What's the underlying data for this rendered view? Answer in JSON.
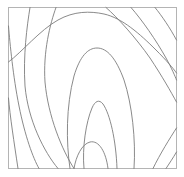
{
  "figure": {
    "title": "",
    "width": 184,
    "height": 177,
    "background_color": "#ffffff"
  },
  "axes": {
    "frame_color": "#b4b4b4",
    "frame_width": 1,
    "x_left": 8.5,
    "x_right": 176.5,
    "y_top": 7.5,
    "y_bottom": 168.5,
    "ticks_visible": false,
    "tick_labels_visible": false,
    "grid": false,
    "xlabel": "",
    "ylabel": ""
  },
  "chart_data": {
    "type": "line",
    "subtype": "contour",
    "title": "",
    "xlabel": "",
    "ylabel": "",
    "xlim": [
      8.5,
      176.5
    ],
    "ylim": [
      7.5,
      168.5
    ],
    "grid": false,
    "legend": null,
    "line_color": "#7d7d7d",
    "line_width": 0.9,
    "n_contours": 7,
    "series": [
      {
        "name": "contour-1-outer-left",
        "apex": null,
        "path": "M 8.5 26 C 10 44 13 76 19 106 C 25 136 33 158 39 168.5"
      },
      {
        "name": "contour-2",
        "apex": null,
        "path": "M 30 7.5 C 27 26 23 56 25 86 C 28 120 44 152 58 168.5"
      },
      {
        "name": "contour-3",
        "apex": null,
        "path": "M 56 7.5 C 50 24 43 52 45 82 C 48 116 62 150 74 168.5"
      },
      {
        "name": "contour-4-apex-top",
        "apex": [
          95,
          13
        ],
        "path": "M 8.5 62 C 22 52 40 30 58 20 C 74 11 90 11 104 14 C 122 18 140 34 156 50 C 166 60 173 68 176.5 73"
      },
      {
        "name": "contour-5",
        "apex": [
          96,
          48
        ],
        "path": "M 70 168.5 C 66 142 66 106 74 76 C 80 56 88 48 97 48 C 107 48 116 58 124 80 C 132 104 136 140 134 168.5"
      },
      {
        "name": "contour-6",
        "apex": [
          98,
          100
        ],
        "path": "M 84 168.5 C 82 148 86 122 92 108 C 95 101 99 99 103 104 C 110 114 116 140 117 168.5"
      },
      {
        "name": "contour-7-inner",
        "apex": [
          92,
          142
        ],
        "path": "M 74 168.5 C 76 156 82 144 90 142 C 99 140 106 152 108 168.5"
      },
      {
        "name": "contour-8-right-outer",
        "apex": null,
        "path": "M 106 7.5 C 118 18 136 38 150 58 C 162 76 171 92 176.5 102"
      },
      {
        "name": "contour-9-right",
        "apex": null,
        "path": "M 131 7.5 C 142 20 156 40 166 58 C 172 69 175 76 176.5 80"
      },
      {
        "name": "contour-10-right-edge",
        "apex": null,
        "path": "M 155 7.5 C 162 16 170 28 176.5 40"
      },
      {
        "name": "contour-11-bottom-left",
        "apex": null,
        "path": "M 8.5 98 C 10 116 14 142 18 168.5"
      },
      {
        "name": "contour-12-right-lower",
        "apex": null,
        "path": "M 176.5 128 C 170 138 160 154 153 168.5"
      },
      {
        "name": "contour-13-right-lower2",
        "apex": null,
        "path": "M 176.5 152 C 173 158 169 164 166 168.5"
      }
    ]
  }
}
